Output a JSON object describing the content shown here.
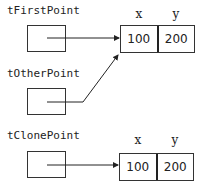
{
  "variables": [
    {
      "name": "tFirstPoint"
    },
    {
      "name": "tOtherPoint"
    },
    {
      "name": "tClonePoint"
    }
  ],
  "objects": [
    {
      "headers": [
        "x",
        "y"
      ],
      "values": [
        "100",
        "200"
      ]
    },
    {
      "headers": [
        "x",
        "y"
      ],
      "values": [
        "100",
        "200"
      ]
    }
  ]
}
